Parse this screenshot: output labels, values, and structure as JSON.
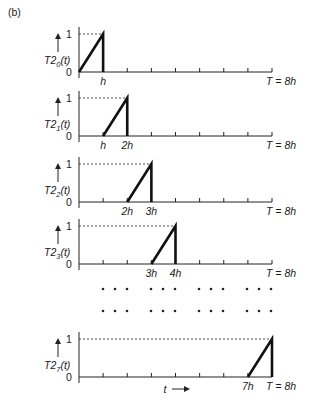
{
  "figure": {
    "panel_label": "(b)",
    "end_label": "T = 8h",
    "x_axis_label": "t",
    "y_tick_one": "1",
    "y_tick_zero": "0",
    "ellipsis": "• • •"
  },
  "chart_data": {
    "type": "line",
    "xlabel": "t",
    "ylabel": "T2_i(t)",
    "xlim": [
      0,
      8
    ],
    "ylim": [
      0,
      1
    ],
    "x_unit": "h",
    "ticks": [
      0,
      1,
      2,
      3,
      4,
      5,
      6,
      7,
      8
    ],
    "series": [
      {
        "name": "T2_0(t)",
        "sub": "0",
        "ramp_start": 0,
        "ramp_end": 1,
        "labels": [
          "h"
        ],
        "label_pos": [
          1
        ]
      },
      {
        "name": "T2_1(t)",
        "sub": "1",
        "ramp_start": 1,
        "ramp_end": 2,
        "labels": [
          "h",
          "2h"
        ],
        "label_pos": [
          1,
          2
        ]
      },
      {
        "name": "T2_2(t)",
        "sub": "2",
        "ramp_start": 2,
        "ramp_end": 3,
        "labels": [
          "2h",
          "3h"
        ],
        "label_pos": [
          2,
          3
        ]
      },
      {
        "name": "T2_3(t)",
        "sub": "3",
        "ramp_start": 3,
        "ramp_end": 4,
        "labels": [
          "3h",
          "4h"
        ],
        "label_pos": [
          3,
          4
        ]
      },
      {
        "name": "T2_7(t)",
        "sub": "7",
        "ramp_start": 7,
        "ramp_end": 8,
        "labels": [
          "7h"
        ],
        "label_pos": [
          7
        ]
      }
    ],
    "annotations": [
      "(b)",
      "T = 8h",
      "t →"
    ]
  }
}
